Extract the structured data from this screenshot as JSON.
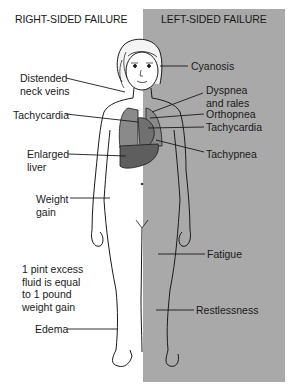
{
  "headers": {
    "right_sided": "RIGHT-SIDED FAILURE",
    "left_sided": "LEFT-SIDED FAILURE"
  },
  "colors": {
    "left_panel_bg": "#a9a9a9",
    "lung": "#8a8a8a",
    "liver": "#5e5e5e",
    "heart": "#707070",
    "line": "#1a1a1a"
  },
  "right_labels": [
    {
      "id": "distended-neck-veins",
      "text": "Distended\nneck veins"
    },
    {
      "id": "tachycardia-right",
      "text": "Tachycardia"
    },
    {
      "id": "enlarged-liver",
      "text": "Enlarged\nliver"
    },
    {
      "id": "weight-gain",
      "text": "Weight\ngain"
    },
    {
      "id": "fluid-note",
      "text": "1 pint excess\nfluid is equal\nto 1 pound\nweight gain"
    },
    {
      "id": "edema",
      "text": "Edema"
    }
  ],
  "left_labels": [
    {
      "id": "cyanosis",
      "text": "Cyanosis"
    },
    {
      "id": "dyspnea-rales",
      "text": "Dyspnea\nand rales"
    },
    {
      "id": "orthopnea",
      "text": "Orthopnea"
    },
    {
      "id": "tachycardia-left",
      "text": "Tachycardia"
    },
    {
      "id": "tachypnea",
      "text": "Tachypnea"
    },
    {
      "id": "fatigue",
      "text": "Fatigue"
    },
    {
      "id": "restlessness",
      "text": "Restlessness"
    }
  ]
}
